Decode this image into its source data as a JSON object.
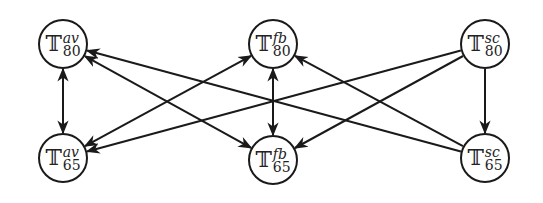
{
  "diagram": {
    "nodes": [
      {
        "id": "T80av",
        "base": "𝕋",
        "sup": "av",
        "sub": "80",
        "x": 63,
        "y": 44
      },
      {
        "id": "T80fb",
        "base": "𝕋",
        "sup": "fb",
        "sub": "80",
        "x": 273,
        "y": 44
      },
      {
        "id": "T80sc",
        "base": "𝕋",
        "sup": "sc",
        "sub": "80",
        "x": 485,
        "y": 44
      },
      {
        "id": "T65av",
        "base": "𝕋",
        "sup": "av",
        "sub": "65",
        "x": 63,
        "y": 158
      },
      {
        "id": "T65fb",
        "base": "𝕋",
        "sup": "fb",
        "sub": "65",
        "x": 273,
        "y": 160
      },
      {
        "id": "T65sc",
        "base": "𝕋",
        "sup": "sc",
        "sub": "65",
        "x": 485,
        "y": 158
      }
    ],
    "edges": [
      {
        "from": "T80av",
        "to": "T65av",
        "bidirectional": true
      },
      {
        "from": "T80fb",
        "to": "T65fb",
        "bidirectional": true
      },
      {
        "from": "T80sc",
        "to": "T65sc",
        "bidirectional": false
      },
      {
        "from": "T80av",
        "to": "T65fb",
        "bidirectional": true
      },
      {
        "from": "T65sc",
        "to": "T80av",
        "bidirectional": false
      },
      {
        "from": "T80fb",
        "to": "T65av",
        "bidirectional": true
      },
      {
        "from": "T80sc",
        "to": "T65av",
        "bidirectional": false
      },
      {
        "from": "T65sc",
        "to": "T80fb",
        "bidirectional": false
      },
      {
        "from": "T80sc",
        "to": "T65fb",
        "bidirectional": false
      }
    ],
    "node_radius": 24,
    "stroke_color": "#1a1a1a"
  }
}
